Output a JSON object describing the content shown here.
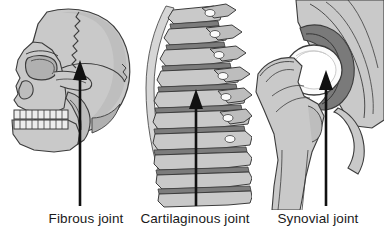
{
  "figure": {
    "background_color": "#ffffff",
    "panels": [
      {
        "id": "fibrous",
        "caption": "Fibrous joint",
        "illustration_name": "lateral-skull-illustration",
        "subject": "human skull, lateral view facing left",
        "pointed_structure": "coronal suture",
        "arrow": {
          "name": "fibrous-joint-arrow",
          "direction": "up",
          "tip_x": 80,
          "tip_y": 60,
          "tail_y": 206,
          "color": "#111111"
        }
      },
      {
        "id": "cartilaginous",
        "caption": "Cartilaginous joint",
        "illustration_name": "vertebral-column-illustration",
        "subject": "vertebral column, lateral view facing left",
        "pointed_structure": "intervertebral disc",
        "arrow": {
          "name": "cartilaginous-joint-arrow",
          "direction": "up",
          "tip_x": 196,
          "tip_y": 89,
          "tail_y": 206,
          "color": "#111111"
        }
      },
      {
        "id": "synovial",
        "caption": "Synovial joint",
        "illustration_name": "hip-joint-illustration",
        "subject": "hip joint, coronal section",
        "pointed_structure": "femoral head in acetabulum",
        "arrow": {
          "name": "synovial-joint-arrow",
          "direction": "up",
          "tip_x": 326,
          "tip_y": 70,
          "tail_y": 206,
          "color": "#111111"
        }
      }
    ],
    "colors": {
      "bone_fill": "#c9c9c9",
      "bone_fill_light": "#d8d8d8",
      "bone_shadow": "#a8a8a8",
      "cartilage_dark": "#7a7a7a",
      "cavity_white": "#fbfbfb",
      "outline": "#3c3c3c",
      "arrow": "#111111",
      "caption_text": "#1a1a1a"
    }
  }
}
